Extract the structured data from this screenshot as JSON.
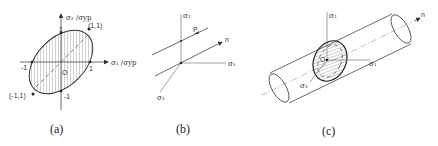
{
  "figure": {
    "panels": [
      {
        "id": "a",
        "caption": "(a)",
        "y_axis_label": "σ₂ /σyp",
        "x_axis_label": "σ₁ /σyp",
        "origin_label": "O",
        "tick_labels": {
          "x_pos": "1",
          "x_neg": "-1",
          "y_pos": "1",
          "y_neg": "-1"
        },
        "points": {
          "upper_right": "(1,1)",
          "lower_left": "(-1,1)"
        },
        "shape": "hatched ellipse (yield locus)"
      },
      {
        "id": "b",
        "caption": "(b)",
        "axes": {
          "vertical": "σ₂",
          "horizontal": "σ₁",
          "diagonal": "σ₃"
        },
        "vector_labels": {
          "point": "P",
          "normal": "n"
        }
      },
      {
        "id": "c",
        "caption": "(c)",
        "axes": {
          "vertical": "σ₂",
          "horizontal": "σ₁",
          "diagonal": "σ₃"
        },
        "origin_label": "O",
        "axis_label": "n",
        "shape": "cylinder with hatched elliptical cross-section"
      }
    ]
  }
}
